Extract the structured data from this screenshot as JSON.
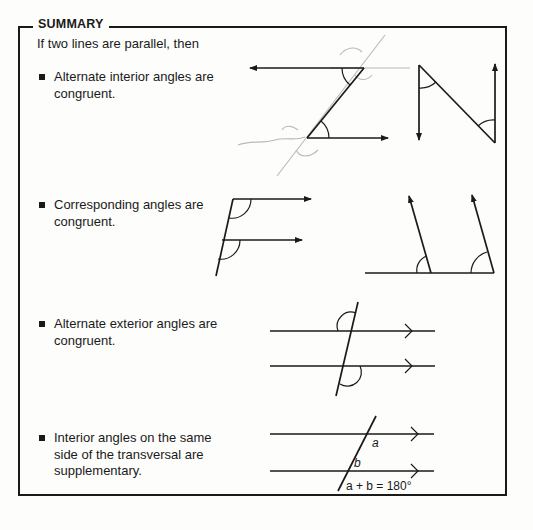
{
  "summary": {
    "title": "SUMMARY",
    "intro": "If two lines are parallel, then",
    "items": [
      {
        "text": "Alternate interior angles are congruent.",
        "figure": "alternate-interior-angles"
      },
      {
        "text": "Corresponding angles are congruent.",
        "figure": "corresponding-angles"
      },
      {
        "text": "Alternate exterior angles are congruent.",
        "figure": "alternate-exterior-angles"
      },
      {
        "text": "Interior angles on the same side of the transversal are supplementary.",
        "figure": "same-side-interior-angles"
      }
    ],
    "figure_labels": {
      "angle_a": "a",
      "angle_b": "b",
      "equation": "a + b = 180°"
    }
  }
}
